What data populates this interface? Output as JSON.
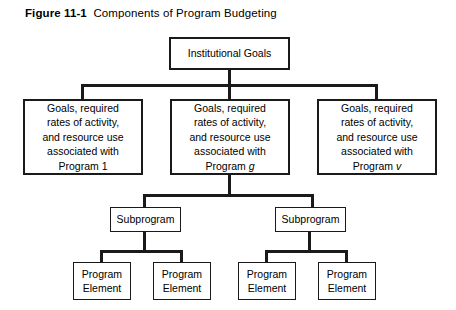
{
  "figure": {
    "label": "Figure 11-1",
    "caption": "Components of Program Budgeting"
  },
  "diagram": {
    "type": "hierarchy-tree",
    "nodes": {
      "root": {
        "text": "Institutional Goals"
      },
      "program_1": {
        "text": "Goals, required\nrates of activity,\nand resource use\nassociated with\nProgram 1"
      },
      "program_g": {
        "text": "Goals, required\nrates of activity,\nand resource use\nassociated with\nProgram g"
      },
      "program_v": {
        "text": "Goals, required\nrates of activity,\nand resource use\nassociated with\nProgram v"
      },
      "subprogram_left": {
        "text": "Subprogram"
      },
      "subprogram_right": {
        "text": "Subprogram"
      },
      "element_1": {
        "text": "Program\nElement"
      },
      "element_2": {
        "text": "Program\nElement"
      },
      "element_3": {
        "text": "Program\nElement"
      },
      "element_4": {
        "text": "Program\nElement"
      }
    },
    "colors": {
      "line": "#1a1a1a",
      "box_fill": "#ffffff",
      "text": "#000000",
      "background": "#ffffff"
    }
  }
}
